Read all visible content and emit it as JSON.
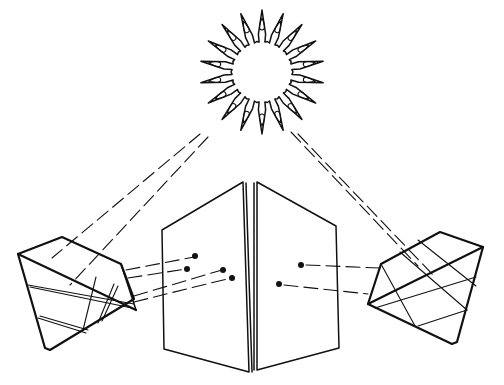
{
  "figure": {
    "colors": {
      "ink": "#111111",
      "background": "#ffffff"
    },
    "elements": [
      {
        "name": "sun",
        "shape": "starburst with flame-shaped rays",
        "center": [
          262,
          72
        ],
        "inner_radius": 30,
        "ray_count": 18
      },
      {
        "name": "left-prism",
        "shape": "faceted crystal",
        "position": "lower-left"
      },
      {
        "name": "right-prism",
        "shape": "faceted crystal",
        "position": "lower-right"
      },
      {
        "name": "folded-screen",
        "shape": "two hinged panels",
        "position": "bottom-center"
      },
      {
        "name": "light-beams-from-sun",
        "count": 4,
        "style": "dashed"
      },
      {
        "name": "refracted-beams-left",
        "count": 4,
        "style": "dashed",
        "endpoint_dots": 4
      },
      {
        "name": "refracted-beams-right",
        "count": 2,
        "style": "dashed",
        "endpoint_dots": 2
      }
    ]
  }
}
